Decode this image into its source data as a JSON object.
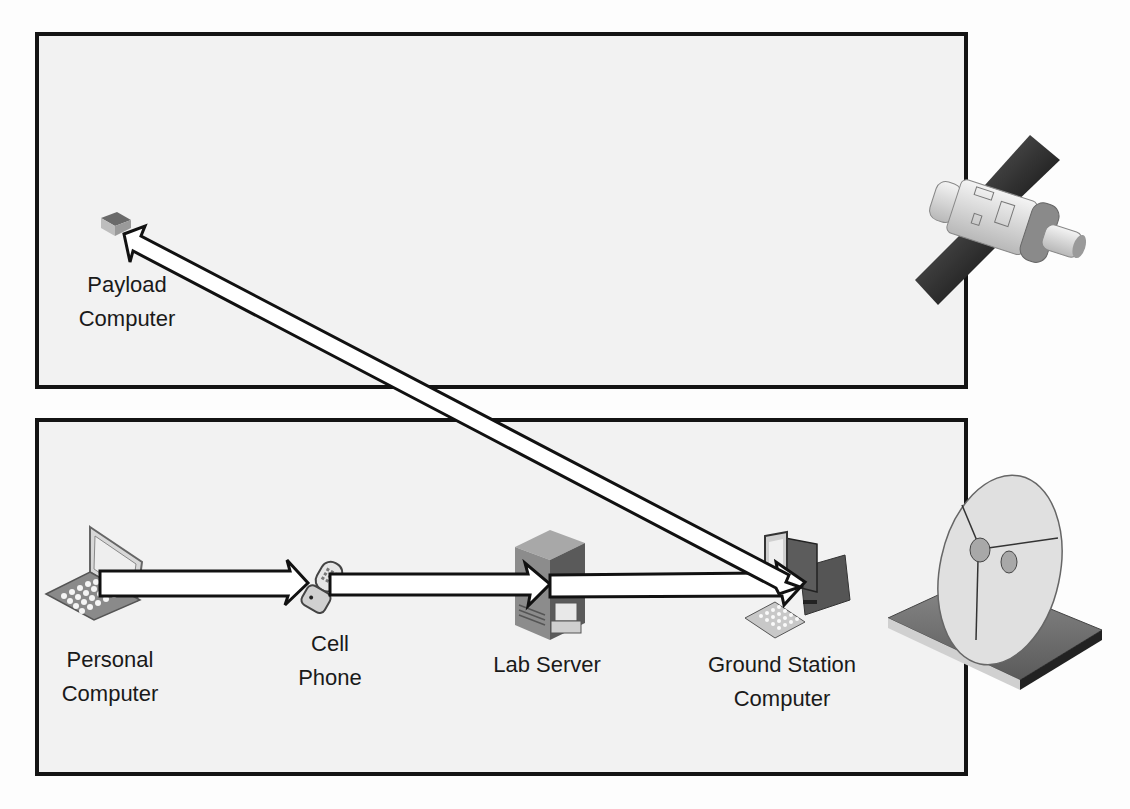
{
  "diagram": {
    "type": "network-communication-diagram",
    "panels": [
      {
        "id": "space-segment",
        "label": ""
      },
      {
        "id": "ground-segment",
        "label": ""
      }
    ],
    "nodes": {
      "payload_computer": {
        "line1": "Payload",
        "line2": "Computer",
        "icon": "payload-computer-icon"
      },
      "personal_computer": {
        "line1": "Personal",
        "line2": "Computer",
        "icon": "laptop-icon"
      },
      "cell_phone": {
        "line1": "Cell",
        "line2": "Phone",
        "icon": "cell-phone-icon"
      },
      "lab_server": {
        "line1": "Lab Server",
        "icon": "server-icon"
      },
      "ground_station_computer": {
        "line1": "Ground Station",
        "line2": "Computer",
        "icon": "desktop-computer-icon"
      },
      "satellite": {
        "icon": "satellite-icon"
      },
      "dish": {
        "icon": "satellite-dish-icon"
      }
    },
    "edges": [
      {
        "from": "Personal Computer",
        "to": "Cell Phone",
        "style": "block-arrow"
      },
      {
        "from": "Cell Phone",
        "to": "Lab Server",
        "style": "block-arrow"
      },
      {
        "from": "Lab Server",
        "to": "Ground Station Computer",
        "style": "block-arrow"
      },
      {
        "from": "Ground Station Computer",
        "to": "Payload Computer",
        "style": "double-headed-block-arrow"
      }
    ],
    "colors": {
      "panel_border": "#141414",
      "panel_fill": "#f2f2f2",
      "arrow_fill": "#ffffff",
      "arrow_stroke": "#111111",
      "solar_panel": "#2a2a2a"
    }
  }
}
